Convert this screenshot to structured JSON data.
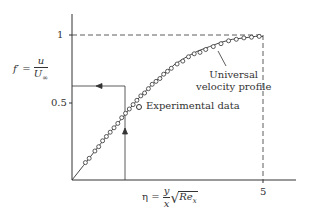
{
  "chart_data": {
    "type": "line",
    "title": "",
    "xlabel": "η = (y/x)·√Re_x",
    "ylabel": "f' = u/U∞",
    "xlim": [
      0,
      5.5
    ],
    "ylim": [
      0,
      1.1
    ],
    "x_ticks": [
      "5"
    ],
    "y_ticks": [
      "0.5",
      "1"
    ],
    "grid": false,
    "legend_position": "inside-right",
    "series": [
      {
        "name": "Universal velocity profile",
        "style": "solid-line",
        "x": [
          0,
          0.3,
          0.6,
          0.9,
          1.2,
          1.5,
          1.8,
          2.1,
          2.4,
          2.7,
          3.0,
          3.3,
          3.6,
          3.9,
          4.2,
          4.5,
          4.8,
          5.0
        ],
        "values": [
          0,
          0.1,
          0.2,
          0.3,
          0.39,
          0.49,
          0.58,
          0.66,
          0.73,
          0.8,
          0.85,
          0.89,
          0.92,
          0.95,
          0.97,
          0.98,
          0.99,
          0.99
        ]
      },
      {
        "name": "Experimental data",
        "style": "open-circle",
        "x": [
          0.35,
          0.45,
          0.6,
          0.7,
          0.8,
          0.9,
          1.0,
          1.1,
          1.2,
          1.3,
          1.4,
          1.5,
          1.6,
          1.7,
          1.8,
          1.9,
          2.0,
          2.1,
          2.2,
          2.3,
          2.4,
          2.5,
          2.6,
          2.75,
          2.9,
          3.05,
          3.2,
          3.35,
          3.5,
          3.7,
          3.9,
          4.1,
          4.3,
          4.5,
          4.7,
          4.9
        ],
        "values": [
          0.12,
          0.15,
          0.2,
          0.23,
          0.27,
          0.3,
          0.33,
          0.36,
          0.39,
          0.43,
          0.46,
          0.49,
          0.52,
          0.55,
          0.58,
          0.6,
          0.63,
          0.66,
          0.68,
          0.7,
          0.73,
          0.75,
          0.77,
          0.8,
          0.82,
          0.85,
          0.87,
          0.88,
          0.9,
          0.92,
          0.94,
          0.96,
          0.97,
          0.98,
          0.985,
          0.99
        ]
      }
    ],
    "annotations": [
      {
        "text": "Universal velocity profile",
        "points_to": [
          2.9,
          0.83
        ]
      },
      {
        "type": "arrow",
        "description": "vertical line at η≈1 rising to the curve, then horizontal arrow left to the f' axis at ≈0.62",
        "x": 1.0,
        "y": 0.62
      },
      {
        "type": "dashed-line",
        "description": "horizontal dashed line at f'=1 from axis to η=5, vertical dashed line at η=5 down to axis"
      }
    ]
  },
  "labels": {
    "y_tick_1": "1",
    "y_tick_05": "0.5",
    "x_tick_5": "5",
    "ylabel_lhs": "f′ =",
    "ylabel_num": "u",
    "ylabel_den": "U",
    "ylabel_den_sub": "∞",
    "xlabel_lhs": "η =",
    "xlabel_num": "y",
    "xlabel_den": "x",
    "xlabel_rad": "√",
    "xlabel_re": "Re",
    "xlabel_re_sub": "x",
    "annotation_line1": "Universal",
    "annotation_line2": "velocity profile",
    "legend_experimental": "Experimental data"
  }
}
